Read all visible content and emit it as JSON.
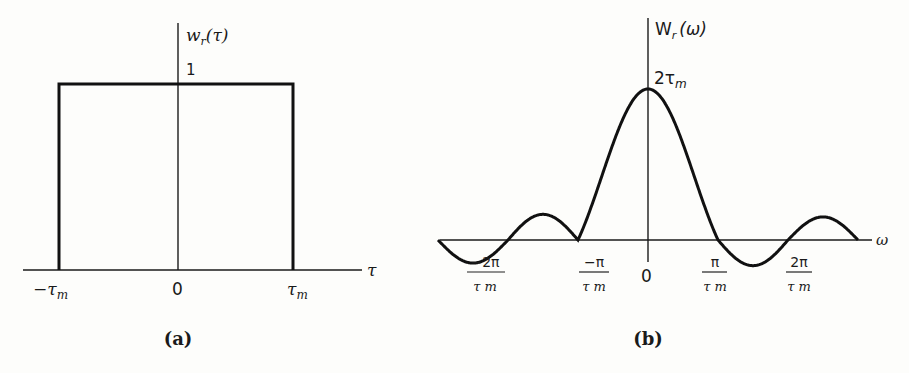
{
  "chart_data": [
    {
      "type": "line",
      "panel": "(a)",
      "title": "",
      "ylabel": "w_r(τ)",
      "xlabel": "τ",
      "description": "Rectangular window: value 1 for -τm ≤ τ ≤ τm, 0 otherwise",
      "x_ticks": [
        "−τm",
        "0",
        "τm"
      ],
      "y_ticks": [
        "1"
      ],
      "x": [
        -1.5,
        -1,
        -1,
        1,
        1,
        1.5
      ],
      "values": [
        0,
        0,
        1,
        1,
        0,
        0
      ],
      "grid": false
    },
    {
      "type": "line",
      "panel": "(b)",
      "title": "",
      "ylabel": "W_r(ω)",
      "xlabel": "ω",
      "description": "Sinc spectrum W_r(ω) = 2 sin(ωτm)/ω, peak 2τm at ω = 0, zero crossings at ±π/τm, ±2π/τm",
      "x_ticks": [
        "−2π/τm",
        "−π/τm",
        "0",
        "π/τm",
        "2π/τm"
      ],
      "y_ticks": [
        "2τm"
      ],
      "x_range_in_pi_over_tau_m": [
        -3,
        3
      ],
      "peak_value": "2τm",
      "zero_crossings": [
        "−2π/τm",
        "−π/τm",
        "π/τm",
        "2π/τm"
      ],
      "grid": false
    }
  ],
  "panel_a": {
    "ylabel_main": "w",
    "ylabel_sub": "r",
    "ylabel_arg": "(τ)",
    "ytick": "1",
    "xlabel": "τ",
    "xticks": [
      {
        "main": "−τ",
        "sub": "m"
      },
      {
        "main": "0",
        "sub": ""
      },
      {
        "main": "τ",
        "sub": "m"
      }
    ],
    "caption": "(a)"
  },
  "panel_b": {
    "ylabel_main": "W",
    "ylabel_sub": "r",
    "ylabel_arg": "(ω)",
    "peak_label_main": "2τ",
    "peak_label_sub": "m",
    "xlabel": "ω",
    "zero_label": "0",
    "frac_ticks": [
      {
        "num": "−2π",
        "den": "τ m"
      },
      {
        "num": "−π",
        "den": "τ m"
      },
      {
        "num": "π",
        "den": "τ m"
      },
      {
        "num": "2π",
        "den": "τ m"
      }
    ],
    "caption": "(b)"
  }
}
